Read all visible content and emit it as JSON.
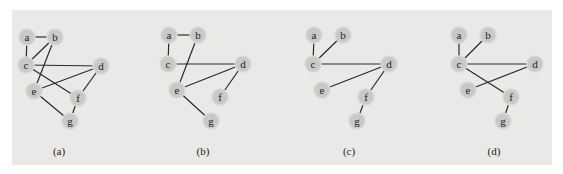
{
  "figure": {
    "panels": [
      {
        "caption": "(a)",
        "caption_pos": [
          59,
          155
        ],
        "nodes": {
          "a": [
            27,
            37
          ],
          "b": [
            55,
            37
          ],
          "c": [
            26,
            65
          ],
          "d": [
            101,
            66
          ],
          "e": [
            34,
            91
          ],
          "f": [
            78,
            98
          ],
          "g": [
            70,
            121
          ]
        },
        "edges": [
          [
            "a",
            "b"
          ],
          [
            "a",
            "c"
          ],
          [
            "b",
            "c"
          ],
          [
            "b",
            "e"
          ],
          [
            "c",
            "d"
          ],
          [
            "c",
            "f"
          ],
          [
            "d",
            "e"
          ],
          [
            "d",
            "f"
          ],
          [
            "e",
            "g"
          ],
          [
            "f",
            "g"
          ]
        ]
      },
      {
        "caption": "(b)",
        "caption_pos": [
          203,
          155
        ],
        "nodes": {
          "a": [
            169,
            35
          ],
          "b": [
            198,
            35
          ],
          "c": [
            168,
            64
          ],
          "d": [
            243,
            64
          ],
          "e": [
            177,
            90
          ],
          "f": [
            220,
            97
          ],
          "g": [
            211,
            121
          ]
        },
        "edges": [
          [
            "a",
            "b"
          ],
          [
            "a",
            "c"
          ],
          [
            "b",
            "e"
          ],
          [
            "c",
            "d"
          ],
          [
            "d",
            "e"
          ],
          [
            "d",
            "f"
          ],
          [
            "e",
            "g"
          ]
        ]
      },
      {
        "caption": "(c)",
        "caption_pos": [
          349,
          155
        ],
        "nodes": {
          "a": [
            314,
            35
          ],
          "b": [
            343,
            35
          ],
          "c": [
            313,
            64
          ],
          "d": [
            389,
            64
          ],
          "e": [
            322,
            90
          ],
          "f": [
            366,
            97
          ],
          "g": [
            357,
            121
          ]
        },
        "edges": [
          [
            "a",
            "c"
          ],
          [
            "b",
            "c"
          ],
          [
            "c",
            "d"
          ],
          [
            "d",
            "e"
          ],
          [
            "d",
            "f"
          ],
          [
            "f",
            "g"
          ]
        ]
      },
      {
        "caption": "(d)",
        "caption_pos": [
          494,
          155
        ],
        "nodes": {
          "a": [
            459,
            35
          ],
          "b": [
            488,
            35
          ],
          "c": [
            459,
            64
          ],
          "d": [
            535,
            64
          ],
          "e": [
            468,
            90
          ],
          "f": [
            511,
            97
          ],
          "g": [
            503,
            121
          ]
        },
        "edges": [
          [
            "a",
            "c"
          ],
          [
            "b",
            "c"
          ],
          [
            "c",
            "d"
          ],
          [
            "c",
            "f"
          ],
          [
            "d",
            "e"
          ],
          [
            "f",
            "g"
          ]
        ]
      }
    ],
    "colors": {
      "panel_bg": "#e9e9e8",
      "node_fill": "#c9c9c8",
      "edge": "#2a2a2a"
    }
  }
}
